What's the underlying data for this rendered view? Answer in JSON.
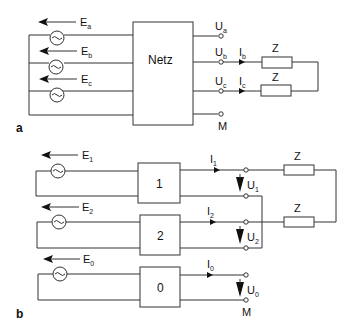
{
  "panels": {
    "a": {
      "label": "a",
      "network_box": "Netz",
      "sources": [
        {
          "name": "E",
          "sub": "a"
        },
        {
          "name": "E",
          "sub": "b"
        },
        {
          "name": "E",
          "sub": "c"
        }
      ],
      "outputs": [
        {
          "name": "U",
          "sub": "a"
        },
        {
          "name": "U",
          "sub": "b"
        },
        {
          "name": "U",
          "sub": "c"
        },
        {
          "name": "M",
          "sub": ""
        }
      ],
      "currents": [
        {
          "name": "I",
          "sub": "b"
        },
        {
          "name": "I",
          "sub": "c"
        }
      ],
      "impedances": [
        "Z",
        "Z"
      ]
    },
    "b": {
      "label": "b",
      "boxes": [
        "1",
        "2",
        "0"
      ],
      "sources": [
        {
          "name": "E",
          "sub": "1"
        },
        {
          "name": "E",
          "sub": "2"
        },
        {
          "name": "E",
          "sub": "0"
        }
      ],
      "currents": [
        {
          "name": "I",
          "sub": "1"
        },
        {
          "name": "I",
          "sub": "2"
        },
        {
          "name": "I",
          "sub": "0"
        }
      ],
      "voltages": [
        {
          "name": "U",
          "sub": "1"
        },
        {
          "name": "U",
          "sub": "2"
        },
        {
          "name": "U",
          "sub": "0"
        }
      ],
      "ground": "M",
      "impedances": [
        "Z",
        "Z"
      ]
    }
  },
  "colors": {
    "line": "#333333",
    "background": "#ffffff"
  }
}
